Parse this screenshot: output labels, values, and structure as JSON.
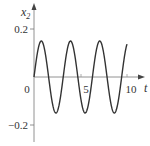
{
  "chart_data": {
    "type": "line",
    "title": "",
    "xlabel": "t",
    "ylabel": "x2",
    "ylabel_main": "x",
    "ylabel_sub": "2",
    "xlim": [
      0,
      10.5
    ],
    "ylim": [
      -0.25,
      0.25
    ],
    "grid": false,
    "legend": null,
    "x_ticks": [
      {
        "value": 5,
        "label": "5"
      },
      {
        "value": 10,
        "label": "10"
      }
    ],
    "y_ticks": [
      {
        "value": 0.2,
        "label": "0.2"
      },
      {
        "value": -0.2,
        "label": "−0.2"
      }
    ],
    "origin_label": "0",
    "series": [
      {
        "name": "x2(t)",
        "description": "sinusoidal oscillation, amplitude ~0.15, angular frequency ~2 rad/unit",
        "amplitude": 0.15,
        "omega": 2.0,
        "t_start": 0,
        "t_end": 10,
        "x": [
          0,
          0.79,
          1.57,
          2.36,
          3.14,
          3.93,
          4.71,
          5.5,
          6.28,
          7.07,
          7.85,
          8.64,
          9.42,
          10.0
        ],
        "y": [
          0,
          0.15,
          0,
          -0.15,
          0,
          0.15,
          0,
          -0.15,
          0,
          0.15,
          0,
          -0.15,
          0,
          0.137
        ]
      }
    ],
    "colors": {
      "curve": "#333333",
      "axes": "#666666"
    }
  }
}
